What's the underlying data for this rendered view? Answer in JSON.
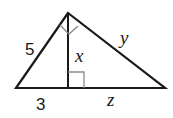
{
  "diagram": {
    "type": "right-triangle-with-altitude",
    "labels": {
      "left_leg": "5",
      "altitude": "x",
      "right_leg": "y",
      "left_segment": "3",
      "right_segment": "z"
    },
    "colors": {
      "stroke": "#1a1a1a",
      "mark": "#8a8a8a",
      "background": "#ffffff"
    }
  }
}
